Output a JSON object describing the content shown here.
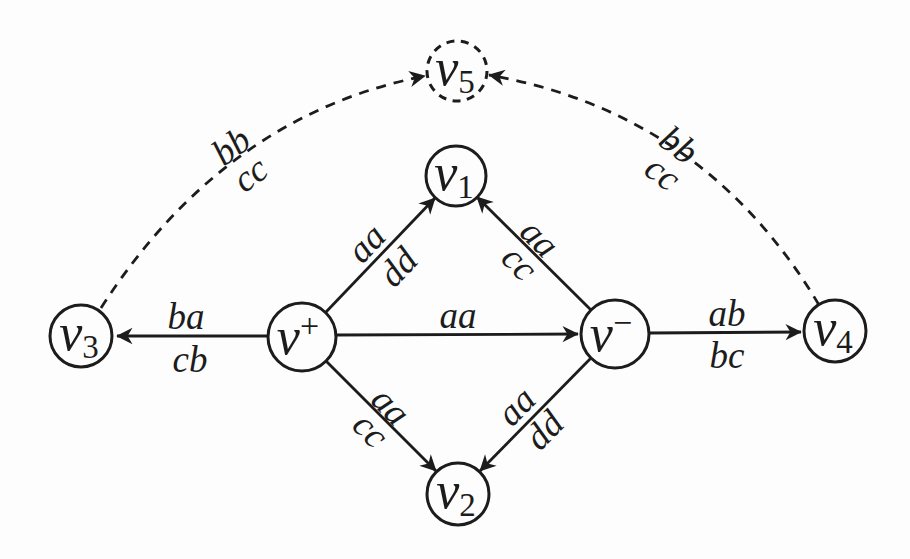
{
  "figure": {
    "type": "directed-graph-diagram",
    "background_color": "#fdfdfd",
    "ink_color": "#1c1c1c"
  },
  "nodes": [
    {
      "id": "v5",
      "base": "v",
      "script": "5",
      "script_type": "sub",
      "outline": "dashed"
    },
    {
      "id": "v1",
      "base": "v",
      "script": "1",
      "script_type": "sub",
      "outline": "solid"
    },
    {
      "id": "v3",
      "base": "v",
      "script": "3",
      "script_type": "sub",
      "outline": "solid"
    },
    {
      "id": "v-plus",
      "base": "v",
      "script": "+",
      "script_type": "sup",
      "outline": "solid"
    },
    {
      "id": "v-minus",
      "base": "v",
      "script": "−",
      "script_type": "sup",
      "outline": "solid"
    },
    {
      "id": "v4",
      "base": "v",
      "script": "4",
      "script_type": "sub",
      "outline": "solid"
    },
    {
      "id": "v2",
      "base": "v",
      "script": "2",
      "script_type": "sub",
      "outline": "solid"
    }
  ],
  "edges": [
    {
      "from": "v-plus",
      "to": "v1",
      "style": "solid",
      "labels": {
        "top": "aa",
        "bottom": "dd"
      }
    },
    {
      "from": "v-minus",
      "to": "v1",
      "style": "solid",
      "labels": {
        "top": "aa",
        "bottom": "cc"
      }
    },
    {
      "from": "v-plus",
      "to": "v3",
      "style": "solid",
      "labels": {
        "top": "ba",
        "bottom": "cb"
      }
    },
    {
      "from": "v-plus",
      "to": "v-minus",
      "style": "solid",
      "labels": {
        "top": "aa"
      }
    },
    {
      "from": "v-minus",
      "to": "v4",
      "style": "solid",
      "labels": {
        "top": "ab",
        "bottom": "bc"
      }
    },
    {
      "from": "v-plus",
      "to": "v2",
      "style": "solid",
      "labels": {
        "top": "aa",
        "bottom": "cc"
      }
    },
    {
      "from": "v-minus",
      "to": "v2",
      "style": "solid",
      "labels": {
        "top": "aa",
        "bottom": "dd"
      }
    },
    {
      "from": "v3",
      "to": "v5",
      "style": "dashed",
      "labels": {
        "top": "bb",
        "bottom": "cc"
      }
    },
    {
      "from": "v4",
      "to": "v5",
      "style": "dashed",
      "labels": {
        "top": "bb",
        "bottom": "cc"
      }
    }
  ]
}
